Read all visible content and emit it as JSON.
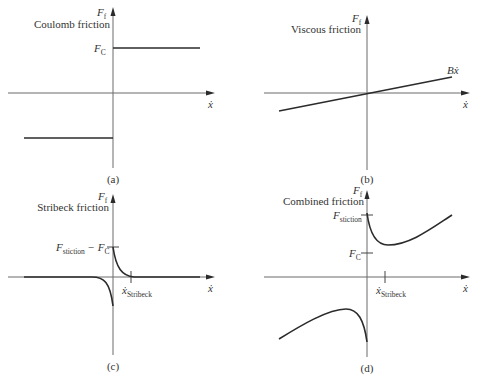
{
  "panels": [
    {
      "id": "a",
      "label": "(a)",
      "title": "Coulomb friction",
      "y_axis_label": "F",
      "y_axis_sub": "f",
      "x_axis_label": "ẋ",
      "ticks": [
        {
          "label": "F",
          "sub": "C"
        }
      ],
      "curve_type": "coulomb"
    },
    {
      "id": "b",
      "label": "(b)",
      "title": "Viscous friction",
      "y_axis_label": "F",
      "y_axis_sub": "f",
      "x_axis_label": "ẋ",
      "curve_annotation": "Bẋ",
      "curve_type": "viscous"
    },
    {
      "id": "c",
      "label": "(c)",
      "title": "Stribeck friction",
      "y_axis_label": "F",
      "y_axis_sub": "f",
      "x_axis_label": "ẋ",
      "ticks": [
        {
          "label": "F",
          "sub": "stiction",
          "suffix": " − F",
          "suffix_sub": "C"
        }
      ],
      "x_ticks": [
        {
          "label": "ẋ",
          "sub": "Stribeck"
        }
      ],
      "curve_type": "stribeck"
    },
    {
      "id": "d",
      "label": "(d)",
      "title": "Combined friction",
      "y_axis_label": "F",
      "y_axis_sub": "f",
      "x_axis_label": "ẋ",
      "ticks": [
        {
          "label": "F",
          "sub": "stiction"
        },
        {
          "label": "F",
          "sub": "C"
        }
      ],
      "x_ticks": [
        {
          "label": "ẋ",
          "sub": "Stribeck"
        }
      ],
      "curve_type": "combined"
    }
  ]
}
